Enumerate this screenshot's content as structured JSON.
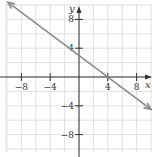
{
  "chart_data": {
    "type": "line",
    "title": "",
    "xlabel": "x",
    "ylabel": "y",
    "xlim": [
      -10,
      10
    ],
    "ylim": [
      -10.5,
      10.5
    ],
    "grid": true,
    "grid_step": 2,
    "x_ticks": [
      -8,
      -4,
      4,
      8
    ],
    "y_ticks": [
      8,
      4,
      -4,
      -8
    ],
    "x_tick_labels": [
      "−8",
      "−4",
      "4",
      "8"
    ],
    "y_tick_labels": [
      "8",
      "4",
      "−4",
      "−8"
    ],
    "series": [
      {
        "name": "y = -3/4 x + 3",
        "equation": "y = -0.75x + 3",
        "arrows": "both",
        "x": [
          -9.9,
          10
        ],
        "y": [
          10.4,
          -4.5
        ],
        "color": "#8a8a8a"
      }
    ]
  },
  "colors": {
    "grid": "#d9d9d9",
    "axis": "#333333",
    "line": "#8a8a8a"
  }
}
